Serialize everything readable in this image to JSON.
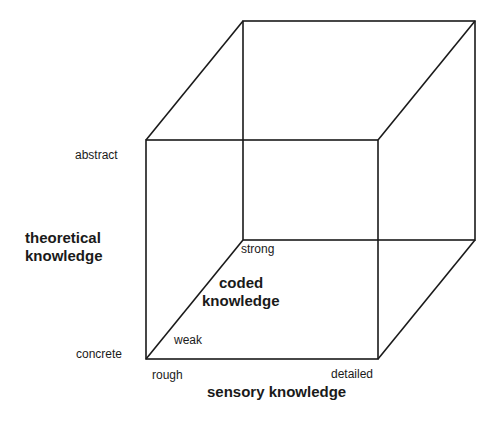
{
  "diagram": {
    "type": "3d-cube-knowledge-space",
    "axes": {
      "vertical": {
        "title_line1": "theoretical",
        "title_line2": "knowledge",
        "low": "concrete",
        "high": "abstract"
      },
      "horizontal": {
        "title": "sensory knowledge",
        "low": "rough",
        "high": "detailed"
      },
      "depth": {
        "title_line1": "coded",
        "title_line2": "knowledge",
        "low": "weak",
        "high": "strong"
      }
    },
    "line_color": "#1a1a1a"
  }
}
